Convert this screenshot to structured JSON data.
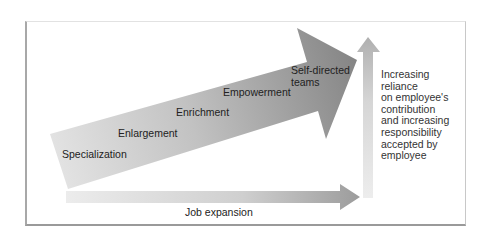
{
  "diagram": {
    "stages": [
      {
        "label": "Specialization"
      },
      {
        "label": "Enlargement"
      },
      {
        "label": "Enrichment"
      },
      {
        "label": "Empowerment"
      },
      {
        "label": "Self-directed",
        "label2": "teams"
      }
    ],
    "x_axis_label": "Job expansion",
    "y_axis_label_lines": [
      "Increasing",
      "reliance",
      "on employee's",
      "contribution",
      "and increasing",
      "responsibility",
      "accepted by",
      "employee"
    ],
    "colors": {
      "main_arrow_light": "#e6e6e6",
      "main_arrow_dark": "#8c8c8c",
      "axis_arrow_light": "#ebebeb",
      "axis_arrow_dark": "#9e9e9e",
      "frame": "#a8a8a8",
      "text": "#222222"
    }
  }
}
